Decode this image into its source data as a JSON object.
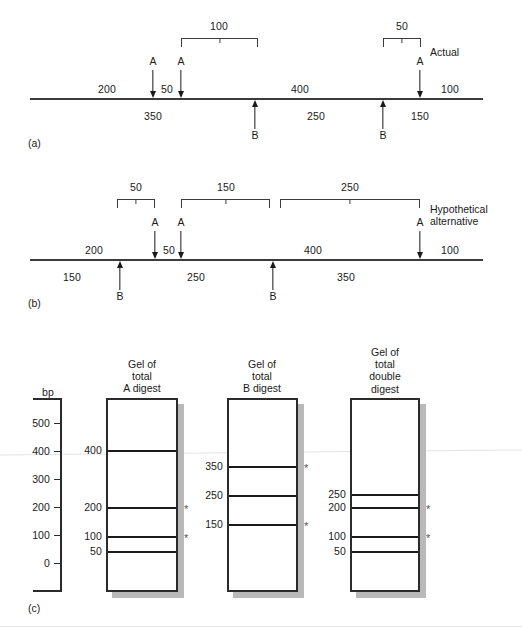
{
  "figure": {
    "units": "bp",
    "panels": [
      {
        "id": "a",
        "letter": "(a)",
        "title": "Actual"
      },
      {
        "id": "b",
        "letter": "(b)",
        "title": "Hypothetical\nalternative"
      },
      {
        "id": "c",
        "letter": "(c)",
        "title": ""
      }
    ]
  },
  "panel_a": {
    "letter": "(a)",
    "side_title": "Actual",
    "brackets": [
      {
        "label": "100"
      },
      {
        "label": "50"
      }
    ],
    "a_sites": [
      {
        "label": "A"
      },
      {
        "label": "A"
      },
      {
        "label": "A"
      }
    ],
    "b_sites": [
      {
        "label": "B"
      },
      {
        "label": "B"
      }
    ],
    "above_fragments": [
      "200",
      "50",
      "400",
      "100"
    ],
    "below_fragments": [
      "350",
      "250",
      "150"
    ]
  },
  "panel_b": {
    "letter": "(b)",
    "side_title": "Hypothetical\nalternative",
    "brackets": [
      {
        "label": "50"
      },
      {
        "label": "150"
      },
      {
        "label": "250"
      }
    ],
    "a_sites": [
      {
        "label": "A"
      },
      {
        "label": "A"
      },
      {
        "label": "A"
      }
    ],
    "b_sites": [
      {
        "label": "B"
      },
      {
        "label": "B"
      }
    ],
    "above_fragments": [
      "200",
      "50",
      "400",
      "100"
    ],
    "below_fragments": [
      "150",
      "250",
      "350"
    ]
  },
  "panel_c": {
    "letter": "(c)",
    "bp_label": "bp",
    "scale_ticks": [
      "500",
      "400",
      "300",
      "200",
      "100",
      "0"
    ],
    "gels": [
      {
        "title": "Gel of\ntotal\nA digest",
        "bands": [
          {
            "label": "400",
            "starred": false
          },
          {
            "label": "200",
            "starred": true
          },
          {
            "label": "100",
            "starred": true
          },
          {
            "label": "50",
            "starred": false
          }
        ]
      },
      {
        "title": "Gel of\ntotal\nB digest",
        "bands": [
          {
            "label": "350",
            "starred": true
          },
          {
            "label": "250",
            "starred": false
          },
          {
            "label": "150",
            "starred": true
          }
        ]
      },
      {
        "title": "Gel of\ntotal\ndouble\ndigest",
        "bands": [
          {
            "label": "250",
            "starred": false
          },
          {
            "label": "200",
            "starred": true
          },
          {
            "label": "100",
            "starred": true
          },
          {
            "label": "50",
            "starred": false
          }
        ]
      }
    ],
    "star_symbol": "*"
  }
}
